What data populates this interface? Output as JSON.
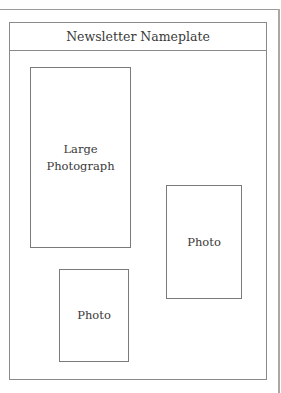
{
  "layout": {
    "nameplate": {
      "label": "Newsletter Nameplate"
    },
    "photos": [
      {
        "id": "large",
        "lines": [
          "Large",
          "Photograph"
        ]
      },
      {
        "id": "right",
        "lines": [
          "Photo"
        ]
      },
      {
        "id": "bottom",
        "lines": [
          "Photo"
        ]
      }
    ]
  },
  "colors": {
    "border": "#8a8a8a",
    "text": "#3a3a3a",
    "background": "#ffffff"
  }
}
